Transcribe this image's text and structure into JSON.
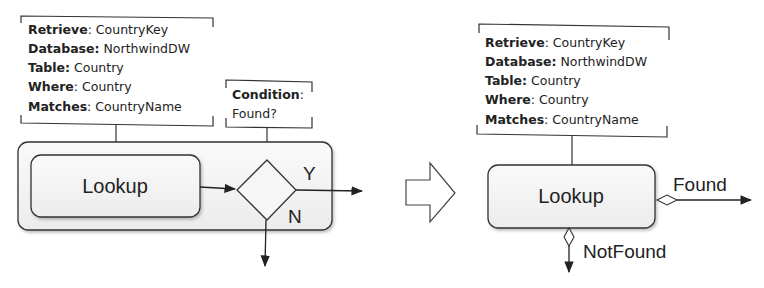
{
  "before": {
    "annotation": [
      {
        "key": "Retrieve",
        "sep": ": ",
        "value": "CountryKey"
      },
      {
        "key": "Database:",
        "sep": " ",
        "value": "NorthwindDW"
      },
      {
        "key": "Table:",
        "sep": " ",
        "value": "Country"
      },
      {
        "key": "Where",
        "sep": ": ",
        "value": "Country"
      },
      {
        "key": "Matches",
        "sep": ": ",
        "value": "CountryName"
      }
    ],
    "condition": {
      "key": "Condition",
      "sep": ":",
      "value": "Found?"
    },
    "task_label": "Lookup",
    "yes_label": "Y",
    "no_label": "N"
  },
  "transform_arrow": "hollow-right-arrow",
  "after": {
    "annotation": [
      {
        "key": "Retrieve",
        "sep": ": ",
        "value": "CountryKey"
      },
      {
        "key": "Database:",
        "sep": " ",
        "value": "NorthwindDW"
      },
      {
        "key": "Table:",
        "sep": " ",
        "value": "Country"
      },
      {
        "key": "Where",
        "sep": ": ",
        "value": "Country"
      },
      {
        "key": "Matches",
        "sep": ": ",
        "value": "CountryName"
      }
    ],
    "task_label": "Lookup",
    "found_label": "Found",
    "notfound_label": "NotFound"
  },
  "colors": {
    "stroke": "#333333",
    "fill": "#f0f0f0",
    "text": "#222222"
  }
}
